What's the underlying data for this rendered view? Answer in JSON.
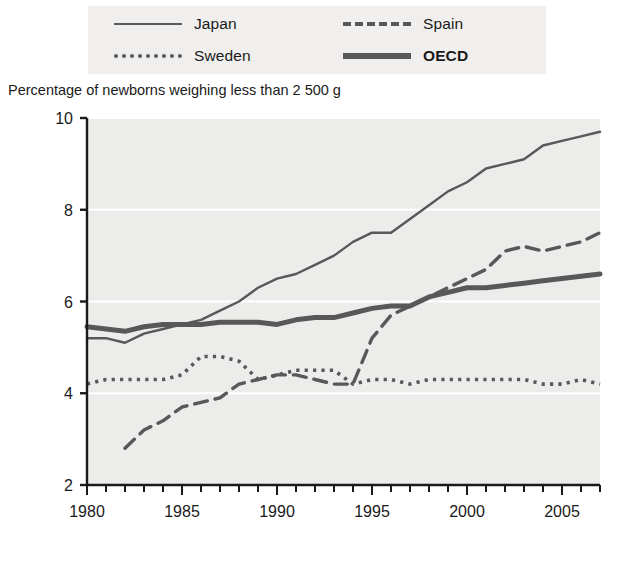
{
  "legend": {
    "items": [
      {
        "label": "Japan",
        "style": "solid-thin",
        "bold": false,
        "color": "#58585a"
      },
      {
        "label": "Spain",
        "style": "dashed",
        "bold": false,
        "color": "#58585a"
      },
      {
        "label": "Sweden",
        "style": "dotted",
        "bold": false,
        "color": "#58585a"
      },
      {
        "label": "OECD",
        "style": "solid-thick",
        "bold": true,
        "color": "#58585a"
      }
    ],
    "background_color": "#f0efed"
  },
  "axis_title": "Percentage of newborns weighing less than 2 500 g",
  "chart_data": {
    "type": "line",
    "title": "Percentage of newborns weighing less than 2 500 g",
    "xlabel": "",
    "ylabel": "",
    "xlim": [
      1980,
      2007
    ],
    "ylim": [
      2,
      10
    ],
    "yticks": [
      2,
      4,
      6,
      8,
      10
    ],
    "ytick_labels": [
      "2",
      "4",
      "6",
      "8",
      "10"
    ],
    "xticks": [
      1980,
      1985,
      1990,
      1995,
      2000,
      2005
    ],
    "xtick_labels": [
      "1980",
      "1985",
      "1990",
      "1995",
      "2000",
      "2005"
    ],
    "minor_xtick_interval": 1,
    "grid": "horizontal-white",
    "plot_background": "#ececea",
    "legend_position": "above-plot",
    "series": [
      {
        "name": "Japan",
        "style": "solid-thin",
        "color": "#58585a",
        "x": [
          1980,
          1981,
          1982,
          1983,
          1984,
          1985,
          1986,
          1987,
          1988,
          1989,
          1990,
          1991,
          1992,
          1993,
          1994,
          1995,
          1996,
          1997,
          1998,
          1999,
          2000,
          2001,
          2002,
          2003,
          2004,
          2005,
          2006,
          2007
        ],
        "values": [
          5.2,
          5.2,
          5.1,
          5.3,
          5.4,
          5.5,
          5.6,
          5.8,
          6.0,
          6.3,
          6.5,
          6.6,
          6.8,
          7.0,
          7.3,
          7.5,
          7.5,
          7.8,
          8.1,
          8.4,
          8.6,
          8.9,
          9.0,
          9.1,
          9.4,
          9.5,
          9.6,
          9.7
        ]
      },
      {
        "name": "Spain",
        "style": "dashed",
        "color": "#58585a",
        "x": [
          1982,
          1983,
          1984,
          1985,
          1986,
          1987,
          1988,
          1989,
          1990,
          1991,
          1992,
          1993,
          1994,
          1995,
          1996,
          1997,
          1998,
          1999,
          2000,
          2001,
          2002,
          2003,
          2004,
          2005,
          2006,
          2007
        ],
        "values": [
          2.8,
          3.2,
          3.4,
          3.7,
          3.8,
          3.9,
          4.2,
          4.3,
          4.4,
          4.4,
          4.3,
          4.2,
          4.2,
          5.2,
          5.7,
          5.9,
          6.1,
          6.3,
          6.5,
          6.7,
          7.1,
          7.2,
          7.1,
          7.2,
          7.3,
          7.5
        ]
      },
      {
        "name": "Sweden",
        "style": "dotted",
        "color": "#58585a",
        "x": [
          1980,
          1981,
          1982,
          1983,
          1984,
          1985,
          1986,
          1987,
          1988,
          1989,
          1990,
          1991,
          1992,
          1993,
          1994,
          1995,
          1996,
          1997,
          1998,
          1999,
          2000,
          2001,
          2002,
          2003,
          2004,
          2005,
          2006,
          2007
        ],
        "values": [
          4.2,
          4.3,
          4.3,
          4.3,
          4.3,
          4.4,
          4.8,
          4.8,
          4.7,
          4.3,
          4.4,
          4.5,
          4.5,
          4.5,
          4.2,
          4.3,
          4.3,
          4.2,
          4.3,
          4.3,
          4.3,
          4.3,
          4.3,
          4.3,
          4.2,
          4.2,
          4.3,
          4.2
        ]
      },
      {
        "name": "OECD",
        "style": "solid-thick",
        "color": "#58585a",
        "x": [
          1980,
          1981,
          1982,
          1983,
          1984,
          1985,
          1986,
          1987,
          1988,
          1989,
          1990,
          1991,
          1992,
          1993,
          1994,
          1995,
          1996,
          1997,
          1998,
          1999,
          2000,
          2001,
          2002,
          2003,
          2004,
          2005,
          2006,
          2007
        ],
        "values": [
          5.45,
          5.4,
          5.35,
          5.45,
          5.5,
          5.5,
          5.5,
          5.55,
          5.55,
          5.55,
          5.5,
          5.6,
          5.65,
          5.65,
          5.75,
          5.85,
          5.9,
          5.9,
          6.1,
          6.2,
          6.3,
          6.3,
          6.35,
          6.4,
          6.45,
          6.5,
          6.55,
          6.6
        ]
      }
    ]
  }
}
